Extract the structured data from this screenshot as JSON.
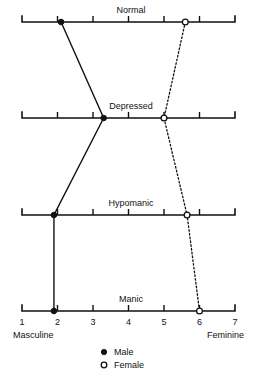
{
  "chart_data": {
    "type": "line",
    "title": "",
    "subtitle": "",
    "xlabel": "",
    "ylabel": "",
    "xlim": [
      1,
      7
    ],
    "grid": false,
    "legend_position": "bottom-center",
    "orientation": "horizontal-panels",
    "categories": [
      "Normal",
      "Depressed",
      "Hypomanic",
      "Manic"
    ],
    "axis_ticks": [
      "1",
      "2",
      "3",
      "4",
      "5",
      "6",
      "7"
    ],
    "axis_pole_left": "Masculine",
    "axis_pole_right": "Feminine",
    "series": [
      {
        "name": "Male",
        "marker": "filled-circle",
        "line_style": "solid",
        "values": [
          2.1,
          3.3,
          1.9,
          1.9
        ]
      },
      {
        "name": "Female",
        "marker": "open-circle",
        "line_style": "dotted",
        "values": [
          5.6,
          5.0,
          5.65,
          6.0
        ]
      }
    ],
    "panels": [
      {
        "label": "Normal",
        "male": 2.1,
        "female": 5.6
      },
      {
        "label": "Depressed",
        "male": 3.3,
        "female": 5.0
      },
      {
        "label": "Hypomanic",
        "male": 1.9,
        "female": 5.65
      },
      {
        "label": "Manic",
        "male": 1.9,
        "female": 6.0
      }
    ]
  },
  "legend": {
    "items": [
      {
        "label": "Male",
        "marker": "filled-circle"
      },
      {
        "label": "Female",
        "marker": "open-circle"
      }
    ]
  },
  "colors": {
    "ink": "#111111",
    "background": "#ffffff",
    "caption": "#9a9a9a"
  },
  "caption": {
    "text": ""
  }
}
